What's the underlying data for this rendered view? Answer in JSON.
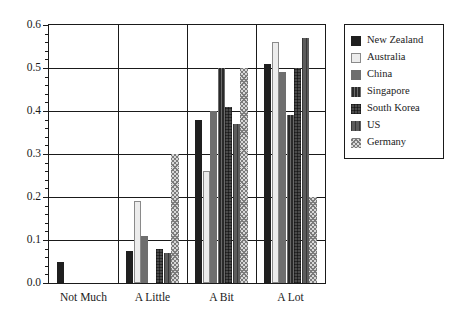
{
  "chart_data": {
    "type": "bar",
    "title": "",
    "xlabel": "",
    "ylabel": "",
    "categories": [
      "Not Much",
      "A Little",
      "A Bit",
      "A Lot"
    ],
    "ylim": [
      0.0,
      0.6
    ],
    "ytick_labels": [
      "0.0",
      "0.1",
      "0.2",
      "0.3",
      "0.4",
      "0.5",
      "0.6"
    ],
    "ytick_values": [
      0.0,
      0.1,
      0.2,
      0.3,
      0.4,
      0.5,
      0.6
    ],
    "yminor_step": 0.02,
    "grid": "horizontal-and-category-separators",
    "legend_position": "right-outside",
    "series": [
      {
        "name": "New Zealand",
        "fill": "solid-black",
        "color": "#1f1f1f",
        "values": [
          0.05,
          0.075,
          0.38,
          0.51
        ]
      },
      {
        "name": "Australia",
        "fill": "solid-light",
        "color": "#ececec",
        "values": [
          0.0,
          0.19,
          0.26,
          0.56
        ]
      },
      {
        "name": "China",
        "fill": "solid-grey",
        "color": "#6e6e6e",
        "values": [
          0.0,
          0.11,
          0.4,
          0.49
        ]
      },
      {
        "name": "Singapore",
        "fill": "vertical-hatch-dark",
        "color": "#2a2a2a",
        "values": [
          0.0,
          0.0,
          0.5,
          0.39
        ]
      },
      {
        "name": "South Korea",
        "fill": "crosshatch-grey",
        "color": "#4a4a4a",
        "values": [
          0.0,
          0.08,
          0.41,
          0.5
        ]
      },
      {
        "name": "US",
        "fill": "vertical-hatch-grey",
        "color": "#5c5c5c",
        "values": [
          0.0,
          0.07,
          0.37,
          0.57
        ]
      },
      {
        "name": "Germany",
        "fill": "diagonal-mesh-light",
        "color": "#d8d8d8",
        "values": [
          0.0,
          0.3,
          0.5,
          0.2
        ]
      }
    ]
  },
  "legend": {
    "entries": [
      "New Zealand",
      "Australia",
      "China",
      "Singapore",
      "South Korea",
      "US",
      "Germany"
    ]
  }
}
